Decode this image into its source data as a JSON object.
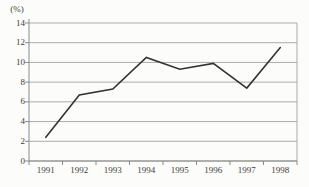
{
  "figure": {
    "unit_label": "(%)"
  },
  "chart_data": {
    "type": "line",
    "title": "",
    "xlabel": "",
    "ylabel": "(%)",
    "categories": [
      "1991",
      "1992",
      "1993",
      "1994",
      "1995",
      "1996",
      "1997",
      "1998"
    ],
    "series": [
      {
        "name": "rate",
        "values": [
          2.4,
          6.7,
          7.3,
          10.5,
          9.3,
          9.9,
          7.4,
          11.5
        ]
      }
    ],
    "ylim": [
      0,
      14
    ],
    "yticks": [
      0,
      2,
      4,
      6,
      8,
      10,
      12,
      14
    ],
    "grid": true,
    "legend_position": "none",
    "colors": {
      "line": "#333333",
      "grid": "#ababab",
      "axis": "#8a8a8a",
      "text": "#3d3d3d",
      "background": "#fcfcfa"
    }
  }
}
